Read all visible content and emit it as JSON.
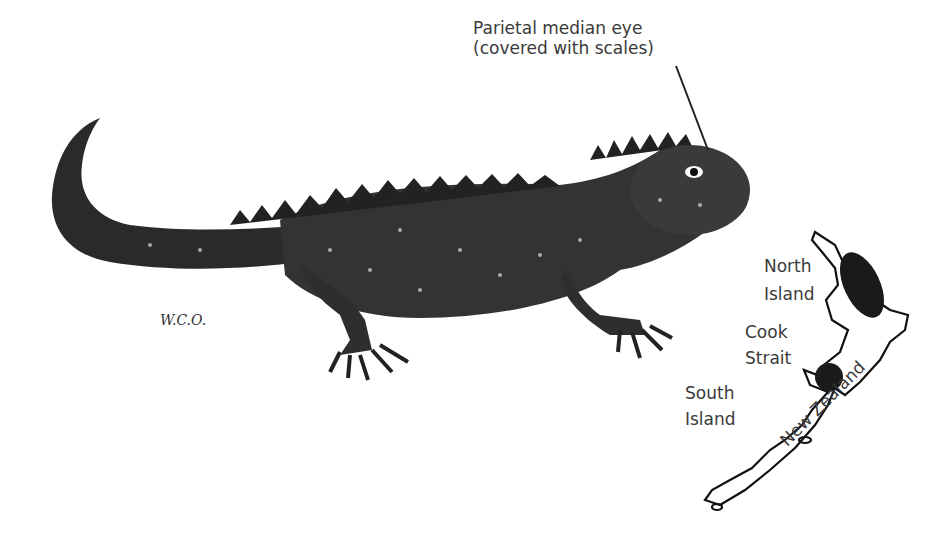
{
  "annotation": {
    "line1": "Parietal median eye",
    "line2": "(covered with scales)"
  },
  "signature": "W.C.O.",
  "map": {
    "north_island": [
      "North",
      "Island"
    ],
    "cook_strait": [
      "Cook",
      "Strait"
    ],
    "south_island": [
      "South",
      "Island"
    ],
    "country": "New Zealand"
  }
}
